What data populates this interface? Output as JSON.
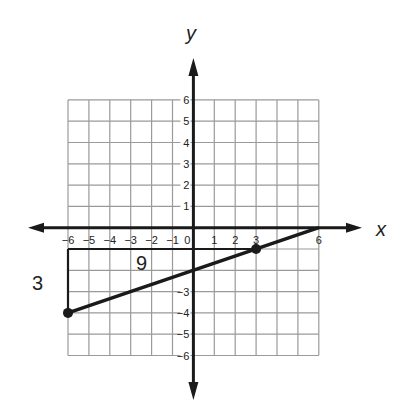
{
  "diagram": {
    "type": "coordinate-plane-line",
    "axes": {
      "x_label": "x",
      "y_label": "y",
      "x_range": [
        -6,
        6
      ],
      "y_range": [
        -6,
        6
      ],
      "x_ticks": [
        "-6",
        "-5",
        "-4",
        "-3",
        "-2",
        "-1",
        "0",
        "1",
        "2",
        "3",
        "6"
      ],
      "y_ticks": [
        "6",
        "5",
        "4",
        "3",
        "2",
        "1",
        "-3",
        "-4",
        "-5",
        "-6"
      ]
    },
    "line": {
      "from": [
        -6,
        -4
      ],
      "to": [
        6,
        0
      ],
      "points": [
        [
          -6,
          -4
        ],
        [
          3,
          -1
        ]
      ]
    },
    "slope_triangle": {
      "run_label": "9",
      "rise_label": "3",
      "corner": [
        -6,
        -1
      ]
    },
    "colors": {
      "grid": "#9a9a9a",
      "axis": "#1a1a1a",
      "line": "#1a1a1a"
    }
  }
}
